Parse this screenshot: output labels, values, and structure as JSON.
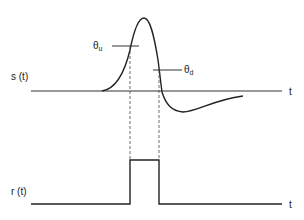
{
  "diagram": {
    "top_panel": {
      "signal_label": "s (t)",
      "axis_label": "t",
      "threshold_up": {
        "symbol": "θ",
        "subscript": "u"
      },
      "threshold_down": {
        "symbol": "θ",
        "subscript": "d"
      }
    },
    "bottom_panel": {
      "signal_label": "r (t)",
      "axis_label": "t"
    },
    "colors": {
      "line": "#222222",
      "background": "#ffffff"
    }
  }
}
